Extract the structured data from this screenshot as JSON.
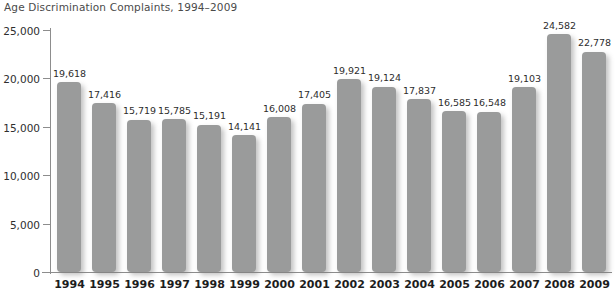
{
  "chart_data": {
    "type": "bar",
    "title": "Age Discrimination Complaints, 1994–2009",
    "xlabel": "",
    "ylabel": "",
    "categories": [
      "1994",
      "1995",
      "1996",
      "1997",
      "1998",
      "1999",
      "2000",
      "2001",
      "2002",
      "2003",
      "2004",
      "2005",
      "2006",
      "2007",
      "2008",
      "2009"
    ],
    "values": [
      19618,
      17416,
      15719,
      15785,
      15191,
      14141,
      16008,
      17405,
      19921,
      19124,
      17837,
      16585,
      16548,
      19103,
      24582,
      22778
    ],
    "value_labels": [
      "19,618",
      "17,416",
      "15,719",
      "15,785",
      "15,191",
      "14,141",
      "16,008",
      "17,405",
      "19,921",
      "19,124",
      "17,837",
      "16,585",
      "16,548",
      "19,103",
      "24,582",
      "22,778"
    ],
    "ylim": [
      0,
      25000
    ],
    "y_ticks": [
      0,
      5000,
      10000,
      15000,
      20000,
      25000
    ],
    "y_tick_labels": [
      "0",
      "5,000",
      "10,000",
      "15,000",
      "20,000",
      "25,000"
    ],
    "grid": false,
    "legend": null,
    "bar_color": "#9a9b9b",
    "axis_color": "#8d8d8d",
    "text_color": "#2e2e2e"
  }
}
